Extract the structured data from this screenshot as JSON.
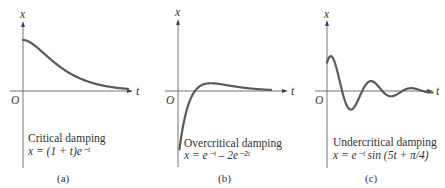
{
  "chart_data": [
    {
      "type": "line",
      "panel": "(a)",
      "title": "Critical damping",
      "equation": "x = (1 + t)e⁻ᵗ",
      "xlabel": "t",
      "ylabel": "x",
      "origin_label": "O",
      "function": "critical",
      "xlim": [
        0,
        5
      ],
      "ylim": [
        -1.2,
        1.4
      ],
      "grid": false
    },
    {
      "type": "line",
      "panel": "(b)",
      "title": "Overcritical damping",
      "equation": "x = e⁻ᵗ – 2e⁻²ᵗ",
      "xlabel": "t",
      "ylabel": "x",
      "origin_label": "O",
      "function": "overcritical",
      "xlim": [
        0,
        5
      ],
      "ylim": [
        -1.2,
        1.4
      ],
      "grid": false
    },
    {
      "type": "line",
      "panel": "(c)",
      "title": "Undercritical damping",
      "equation": "x = e⁻ᵗ sin (5t + π/4)",
      "xlabel": "t",
      "ylabel": "x",
      "origin_label": "O",
      "function": "undercritical",
      "xlim": [
        0,
        3
      ],
      "ylim": [
        -1.2,
        1.4
      ],
      "grid": false
    }
  ]
}
